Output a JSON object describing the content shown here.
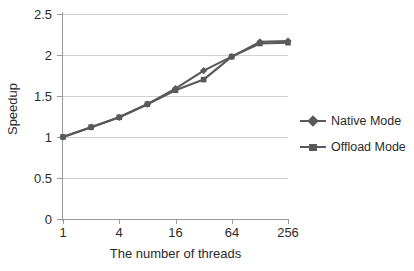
{
  "chart_data": {
    "type": "line",
    "title": "",
    "xlabel": "The number of threads",
    "ylabel": "Speedup",
    "x": [
      1,
      2,
      4,
      8,
      16,
      32,
      64,
      128,
      256
    ],
    "xscale": "log2",
    "xticks": [
      1,
      4,
      16,
      64,
      256
    ],
    "xtick_labels": [
      "1",
      "4",
      "16",
      "64",
      "256"
    ],
    "yticks": [
      0,
      0.5,
      1,
      1.5,
      2,
      2.5
    ],
    "ytick_labels": [
      "0",
      "0.5",
      "1",
      "1.5",
      "2",
      "2.5"
    ],
    "ylim": [
      0,
      2.5
    ],
    "grid": "horizontal",
    "legend_position": "right",
    "series": [
      {
        "name": "Native Mode",
        "marker": "diamond",
        "color": "#595959",
        "values": [
          1.0,
          1.12,
          1.24,
          1.4,
          1.59,
          1.81,
          1.98,
          2.16,
          2.17
        ]
      },
      {
        "name": "Offload Mode",
        "marker": "square",
        "color": "#595959",
        "values": [
          1.0,
          1.12,
          1.24,
          1.4,
          1.57,
          1.7,
          1.98,
          2.14,
          2.15
        ]
      }
    ]
  },
  "axes": {
    "x_title": "The number of threads",
    "y_title": "Speedup"
  },
  "legend": {
    "items": [
      {
        "label": "Native Mode",
        "marker": "diamond"
      },
      {
        "label": "Offload Mode",
        "marker": "square"
      }
    ]
  },
  "colors": {
    "series": "#595959",
    "gridline": "#d0d0d0",
    "axis": "#9a9a9a",
    "text": "#2b2b2b",
    "background": "#ffffff"
  }
}
